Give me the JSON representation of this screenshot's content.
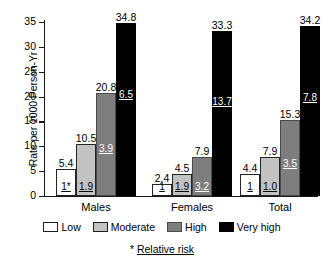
{
  "chart_data": {
    "type": "bar",
    "title": "",
    "xlabel": "",
    "ylabel": "Rate per 1000 Person-Yr",
    "ylim": [
      0,
      35
    ],
    "yticks": [
      0,
      5,
      10,
      15,
      20,
      25,
      30,
      35
    ],
    "grid": false,
    "legend_position": "bottom",
    "categories": [
      "Males",
      "Females",
      "Total"
    ],
    "series": [
      {
        "name": "Low",
        "color": "#ffffff",
        "values": [
          5.4,
          2.4,
          4.4
        ],
        "value_labels": [
          "5.4",
          "2.4",
          "4.4"
        ],
        "relative_risk_labels": [
          "1*",
          "1",
          "1"
        ]
      },
      {
        "name": "Moderate",
        "color": "#c2c2c2",
        "values": [
          10.5,
          4.5,
          7.9
        ],
        "value_labels": [
          "10.5",
          "4.5",
          "7.9"
        ],
        "relative_risk_labels": [
          "1.9",
          "1.9",
          "1.0"
        ]
      },
      {
        "name": "High",
        "color": "#7e7e7e",
        "values": [
          20.8,
          7.9,
          15.3
        ],
        "value_labels": [
          "20.8",
          "7.9",
          "15.3"
        ],
        "relative_risk_labels": [
          "3.9",
          "3.2",
          "3.5"
        ]
      },
      {
        "name": "Very high",
        "color": "#000000",
        "values": [
          34.8,
          33.3,
          34.2
        ],
        "value_labels": [
          "34.8",
          "33.3",
          "34.2"
        ],
        "relative_risk_labels": [
          "6.5",
          "13.7",
          "7.8"
        ]
      }
    ],
    "annotations": {
      "footnote_star": "*",
      "footnote_text": "Relative risk"
    }
  }
}
